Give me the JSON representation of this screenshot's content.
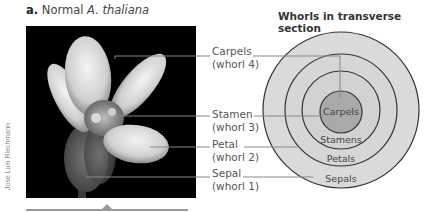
{
  "panel": {
    "letter": "a.",
    "title_prefix": "Normal ",
    "title_species": "A. thaliana"
  },
  "photo_credit": "Jose Luis Riechmann",
  "diagram": {
    "title": "Whorls in transverse section",
    "rings": [
      {
        "label": "Sepals",
        "fill": "#d9d9d9"
      },
      {
        "label": "Petals",
        "fill": "#d4d4d4"
      },
      {
        "label": "Stamens",
        "fill": "#cfcfcf"
      },
      {
        "label": "Carpels",
        "fill": "#a8a8a8"
      }
    ]
  },
  "callouts": [
    {
      "name": "Carpels",
      "whorl": "(whorl 4)"
    },
    {
      "name": "Stamen",
      "whorl": "(whorl 3)"
    },
    {
      "name": "Petal",
      "whorl": "(whorl 2)"
    },
    {
      "name": "Sepal",
      "whorl": "(whorl 1)"
    }
  ]
}
